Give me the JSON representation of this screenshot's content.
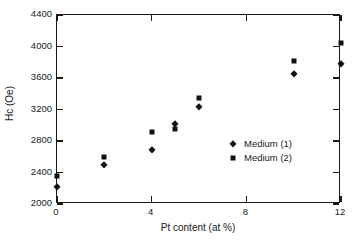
{
  "chart_data": {
    "type": "scatter",
    "title": "",
    "xlabel": "Pt content (at %)",
    "ylabel": "Hc (Oe)",
    "xlim": [
      0,
      12
    ],
    "ylim": [
      2000,
      4400
    ],
    "xticks": [
      0,
      4,
      8,
      12
    ],
    "yticks": [
      2000,
      2400,
      2800,
      3200,
      3600,
      4000,
      4400
    ],
    "xtick_labels": [
      "0",
      "4",
      "8",
      "12"
    ],
    "ytick_labels": [
      "2000",
      "2400",
      "2800",
      "3200",
      "3600",
      "4000",
      "4400"
    ],
    "grid": false,
    "legend_position": "center-right-inside",
    "series": [
      {
        "name": "Medium (1)",
        "marker": "diamond",
        "color": "#111111",
        "points": [
          {
            "x": 0,
            "y": 2220
          },
          {
            "x": 2,
            "y": 2500
          },
          {
            "x": 4,
            "y": 2680
          },
          {
            "x": 5,
            "y": 3010
          },
          {
            "x": 6,
            "y": 3230
          },
          {
            "x": 10,
            "y": 3650
          },
          {
            "x": 12,
            "y": 3780
          }
        ]
      },
      {
        "name": "Medium (2)",
        "marker": "square",
        "color": "#111111",
        "points": [
          {
            "x": 0,
            "y": 2350
          },
          {
            "x": 2,
            "y": 2600
          },
          {
            "x": 4,
            "y": 2920
          },
          {
            "x": 5,
            "y": 2950
          },
          {
            "x": 6,
            "y": 3350
          },
          {
            "x": 10,
            "y": 3820
          },
          {
            "x": 12,
            "y": 4050
          }
        ]
      }
    ]
  },
  "legend": {
    "entries": [
      {
        "label": "Medium (1)",
        "marker": "diamond"
      },
      {
        "label": "Medium (2)",
        "marker": "square"
      }
    ]
  }
}
